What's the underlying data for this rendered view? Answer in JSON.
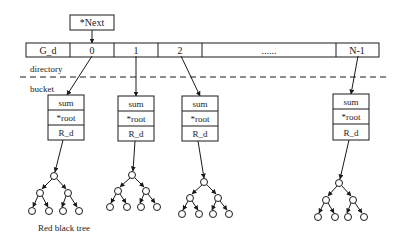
{
  "diagram": {
    "next_pointer": {
      "label": "*Next"
    },
    "directory": {
      "label": "directory",
      "cells": [
        {
          "label": "G_d",
          "x": 26,
          "w": 44
        },
        {
          "label": "0",
          "x": 70,
          "w": 44
        },
        {
          "label": "1",
          "x": 114,
          "w": 44
        },
        {
          "label": "2",
          "x": 158,
          "w": 44
        },
        {
          "label": "......",
          "x": 202,
          "w": 134
        },
        {
          "label": "N-1",
          "x": 336,
          "w": 43
        }
      ]
    },
    "separator": {
      "style": "dashed"
    },
    "bucket_section": {
      "label": "bucket"
    },
    "buckets": [
      {
        "fields": [
          "sum",
          "*root",
          "R_d"
        ]
      },
      {
        "fields": [
          "sum",
          "*root",
          "R_d"
        ]
      },
      {
        "fields": [
          "sum",
          "*root",
          "R_d"
        ]
      },
      {
        "fields": [
          "sum",
          "*root",
          "R_d"
        ]
      }
    ],
    "tree_caption": "Red black tree",
    "colors": {
      "stroke": "#1a1a1a",
      "background": "#ffffff"
    }
  }
}
